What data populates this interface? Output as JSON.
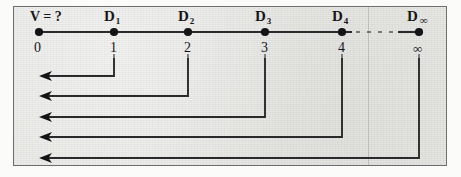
{
  "figure": {
    "type": "number-line-diagram",
    "background_color": "#e9e9e6",
    "ink_color": "#17171a",
    "question_label": "V = ?"
  },
  "axis": {
    "y": 32,
    "x_start": 39,
    "x_end": 419,
    "dashed_gap": {
      "from": 352,
      "to": 398
    }
  },
  "nodes": [
    {
      "id": "n0",
      "top_label": "V = ?",
      "has_subscript": false,
      "subscript": "",
      "number": "0",
      "x": 39,
      "has_arrow": false,
      "top_is_question": true
    },
    {
      "id": "n1",
      "top_label": "D",
      "has_subscript": true,
      "subscript": "1",
      "number": "1",
      "x": 114,
      "has_arrow": true,
      "arrow_y": 76,
      "top_is_question": false
    },
    {
      "id": "n2",
      "top_label": "D",
      "has_subscript": true,
      "subscript": "2",
      "number": "2",
      "x": 188,
      "has_arrow": true,
      "arrow_y": 96,
      "top_is_question": false
    },
    {
      "id": "n3",
      "top_label": "D",
      "has_subscript": true,
      "subscript": "3",
      "number": "3",
      "x": 265,
      "has_arrow": true,
      "arrow_y": 117,
      "top_is_question": false
    },
    {
      "id": "n4",
      "top_label": "D",
      "has_subscript": true,
      "subscript": "4",
      "number": "4",
      "x": 342,
      "has_arrow": true,
      "arrow_y": 137,
      "top_is_question": false
    },
    {
      "id": "ninf",
      "top_label": "D",
      "has_subscript": true,
      "subscript": "∞",
      "number": "∞",
      "x": 419,
      "has_arrow": true,
      "arrow_y": 158,
      "top_is_question": false
    }
  ],
  "labels": {
    "top_row_y": 16,
    "number_row_y": 48,
    "d1": "D",
    "d1_sub": "1",
    "d2": "D",
    "d2_sub": "2",
    "d3": "D",
    "d3_sub": "3",
    "d4": "D",
    "d4_sub": "4",
    "dinf": "D",
    "dinf_sub": "∞",
    "n0": "0",
    "n1": "1",
    "n2": "2",
    "n3": "3",
    "n4": "4",
    "ninf": "∞",
    "vq": "V = ?"
  },
  "arrows": {
    "target_x": 39,
    "head_length": 13,
    "head_half_width": 5,
    "rows": [
      {
        "from_x": 114,
        "y": 76,
        "source": "1"
      },
      {
        "from_x": 188,
        "y": 96,
        "source": "2"
      },
      {
        "from_x": 265,
        "y": 117,
        "source": "3"
      },
      {
        "from_x": 342,
        "y": 137,
        "source": "4"
      },
      {
        "from_x": 419,
        "y": 158,
        "source": "∞"
      }
    ]
  }
}
